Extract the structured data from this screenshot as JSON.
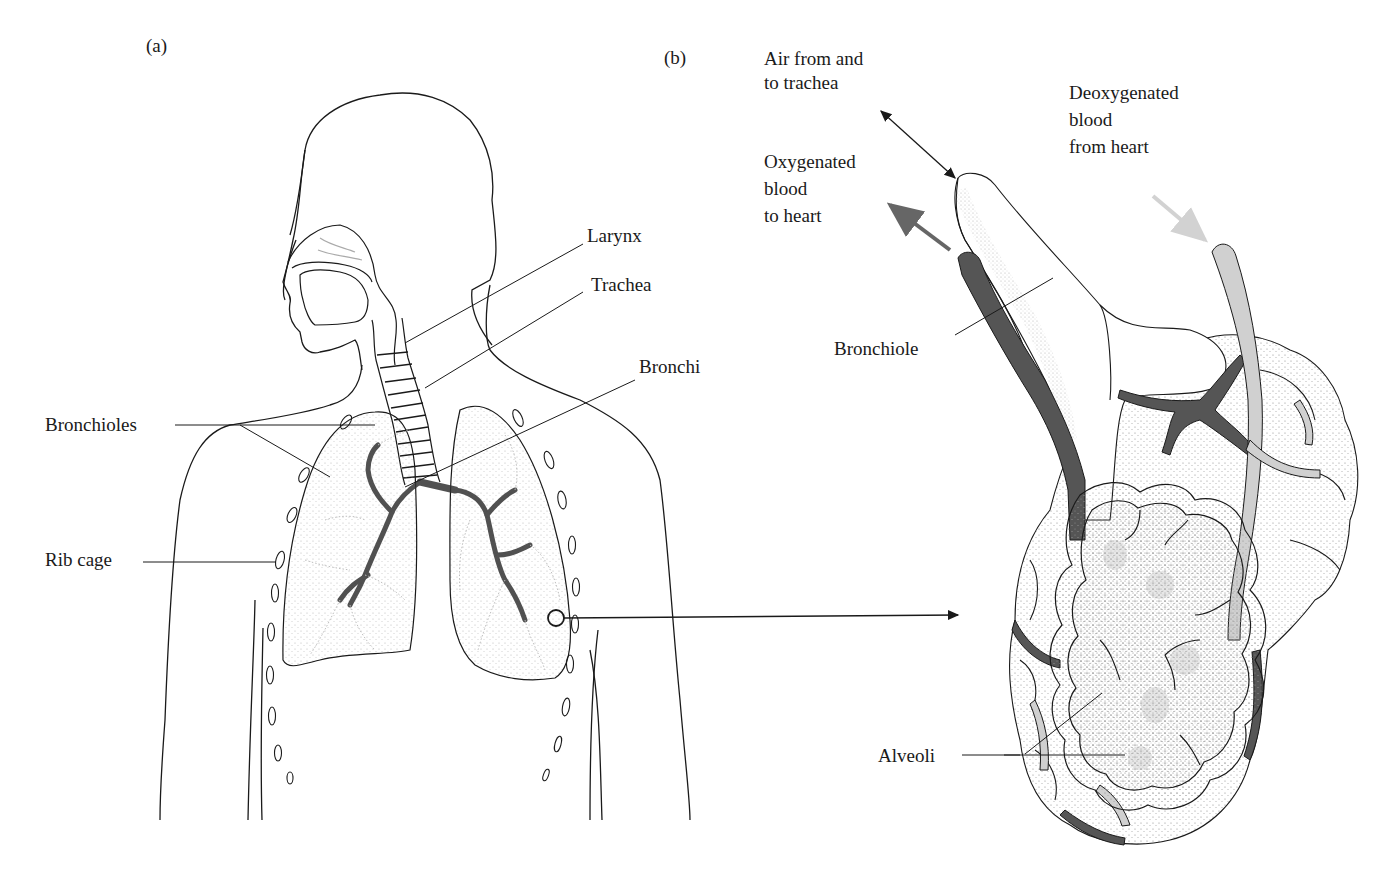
{
  "panel_a": {
    "tag": "(a)",
    "labels": {
      "larynx": "Larynx",
      "trachea": "Trachea",
      "bronchi": "Bronchi",
      "bronchioles": "Bronchioles",
      "rib_cage": "Rib cage"
    }
  },
  "panel_b": {
    "tag": "(b)",
    "labels": {
      "air": "Air from and\nto trachea",
      "oxygenated": "Oxygenated\nblood\nto heart",
      "deoxygenated": "Deoxygenated\nblood\nfrom heart",
      "bronchiole": "Bronchiole",
      "alveoli": "Alveoli"
    }
  },
  "colors": {
    "line": "#1a1a1a",
    "oxygenated_vessel": "#555555",
    "deoxygenated_vessel": "#c8c8c8",
    "stipple": "#9a9a9a"
  }
}
